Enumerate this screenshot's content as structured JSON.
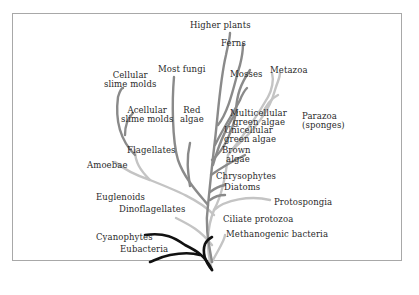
{
  "diagram": {
    "type": "phylogenetic-tree",
    "colors": {
      "bacteria": "#111111",
      "plants_fungi": "#8a8a8a",
      "protists_animals": "#c4c4c4",
      "frame": "#a8a8a8"
    },
    "labels": {
      "higher_plants": "Higher plants",
      "ferns": "Ferns",
      "mosses": "Mosses",
      "metazoa": "Metazoa",
      "most_fungi": "Most fungi",
      "cellular_slime_molds_1": "Cellular",
      "cellular_slime_molds_2": "slime molds",
      "acellular_slime_molds_1": "Acellular",
      "acellular_slime_molds_2": "slime molds",
      "red_algae_1": "Red",
      "red_algae_2": "algae",
      "multicellular_green_algae_1": "Multicellular",
      "multicellular_green_algae_2": "green algae",
      "unicellular_green_algae_1": "Unicellular",
      "unicellular_green_algae_2": "green algae",
      "brown_algae_1": "Brown",
      "brown_algae_2": "algae",
      "parazoa_1": "Parazoa",
      "parazoa_2": "(sponges)",
      "flagellates": "Flagellates",
      "amoebae": "Amoebae",
      "chrysophytes": "Chrysophytes",
      "diatoms": "Diatoms",
      "euglenoids": "Euglenoids",
      "protospongia": "Protospongia",
      "dinoflagellates": "Dinoflagellates",
      "ciliate_protozoa": "Ciliate protozoa",
      "methanogenic_bacteria": "Methanogenic bacteria",
      "cyanophytes": "Cyanophytes",
      "eubacteria": "Eubacteria"
    }
  }
}
